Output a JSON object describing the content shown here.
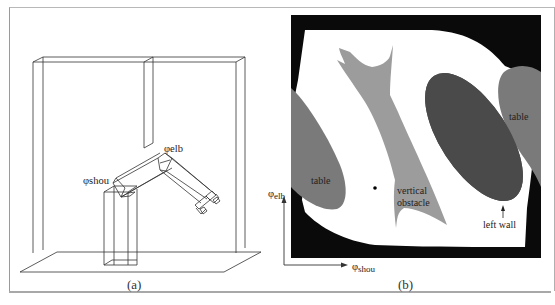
{
  "figure": {
    "panels": [
      {
        "id": "a",
        "caption": "(a)",
        "description": "3D wireframe of a two-link robot arm mounted on a pedestal between walls, with a vertical obstacle hanging from the top and a table as floor",
        "labels": {
          "shoulder_joint": "φshou",
          "elbow_joint": "φelb"
        }
      },
      {
        "id": "b",
        "caption": "(b)",
        "description": "Configuration space of the arm; black = joint-limit region, white = free space, grays = obstacles",
        "labels": {
          "table_left": "table",
          "table_right": "table",
          "vertical_obstacle_line1": "vertical",
          "vertical_obstacle_line2": "obstacle",
          "left_wall": "left wall",
          "y_axis_symbol": "φ",
          "y_axis_sub": "elb",
          "x_axis_symbol": "φ",
          "x_axis_sub": "shou"
        },
        "colors": {
          "background_black": "#0a0a0a",
          "free_space": "#ffffff",
          "table_gray": "#7a7a7a",
          "vertical_obstacle_gray": "#9c9c9c",
          "left_wall_dark": "#4a4a4a"
        }
      }
    ]
  }
}
